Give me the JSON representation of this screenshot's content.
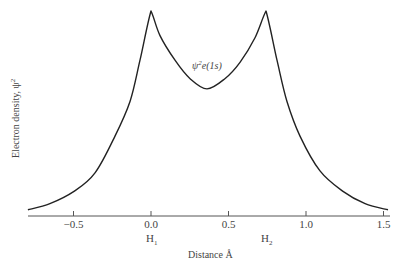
{
  "chart_data": {
    "type": "line",
    "title": "",
    "xlabel": "Distance Å",
    "ylabel": "Electron density, ψ²",
    "xlim": [
      -0.8,
      1.55
    ],
    "ylim": [
      0,
      1.0
    ],
    "xticks": [
      -0.5,
      0.0,
      0.5,
      1.0,
      1.5
    ],
    "xtick_labels": [
      "−0.5",
      "0.0",
      "0.5",
      "1.0",
      "1.5"
    ],
    "grid": false,
    "legend": null,
    "nuclei": [
      {
        "label": "H",
        "subscript": "1",
        "x": 0.0
      },
      {
        "label": "H",
        "subscript": "2",
        "x": 0.74
      }
    ],
    "annotation": {
      "text": "ψ²e(1s)",
      "x": 0.37,
      "y": 0.76
    },
    "series": [
      {
        "name": "ψ²e(1s)",
        "x": [
          -0.794,
          -0.652,
          -0.497,
          -0.361,
          -0.232,
          -0.135,
          -0.071,
          0.0,
          0.058,
          0.155,
          0.252,
          0.361,
          0.477,
          0.574,
          0.671,
          0.742,
          0.813,
          0.877,
          0.961,
          1.09,
          1.239,
          1.381,
          1.529
        ],
        "values": [
          0.03,
          0.06,
          0.12,
          0.21,
          0.39,
          0.56,
          0.76,
          1.0,
          0.88,
          0.76,
          0.67,
          0.62,
          0.67,
          0.75,
          0.87,
          1.0,
          0.76,
          0.56,
          0.39,
          0.22,
          0.12,
          0.06,
          0.03
        ]
      }
    ]
  },
  "labels": {
    "xlabel": "Distance Å",
    "ylabel": "Electron density, ψ²",
    "annotation_main": "ψ",
    "annotation_sup": "2",
    "annotation_rest": "e(1s)",
    "h1_main": "H",
    "h1_sub": "1",
    "h2_main": "H",
    "h2_sub": "2",
    "ylabel_main": "Electron density, ψ",
    "ylabel_sup": "2"
  }
}
